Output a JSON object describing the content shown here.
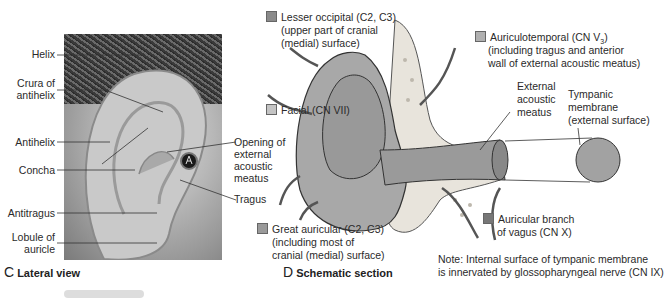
{
  "panel_c": {
    "caption_letter": "C",
    "caption_text": "Lateral view",
    "labels": {
      "helix": "Helix",
      "crura_1": "Crura of",
      "crura_2": "antihelix",
      "antihelix": "Antihelix",
      "concha": "Concha",
      "antitragus": "Antitragus",
      "lobule_1": "Lobule of",
      "lobule_2": "auricle",
      "opening_1": "Opening of",
      "opening_2": "external",
      "opening_3": "acoustic",
      "opening_4": "meatus",
      "tragus": "Tragus"
    }
  },
  "panel_d": {
    "caption_letter": "D",
    "caption_text": "Schematic section",
    "legend_colors": {
      "lesser_occipital": "#8a8a8a",
      "facial": "#c4c4c4",
      "auriculotemporal": "#b0b0b0",
      "great_auricular": "#9a9a9a",
      "vagus": "#777777"
    },
    "labels": {
      "lesser_occipital_1": "Lesser occipital (C2, C3)",
      "lesser_occipital_2": "(upper part of cranial",
      "lesser_occipital_3": "(medial) surface)",
      "facial": "Facial (CN VII)",
      "auriculotemporal_1": "Auriculotemporal (CN V",
      "auriculotemporal_sub": "3",
      "auriculotemporal_close": ")",
      "auriculotemporal_2": "(including tragus and anterior",
      "auriculotemporal_3": "wall of external acoustic meatus)",
      "eam_1": "External",
      "eam_2": "acoustic",
      "eam_3": "meatus",
      "tympanic_1": "Tympanic",
      "tympanic_2": "membrane",
      "tympanic_3": "(external surface)",
      "great_auricular_1": "Great auricular (C2, C3)",
      "great_auricular_2": "(including most of",
      "great_auricular_3": "cranial (medial) surface)",
      "vagus_1": "Auricular branch",
      "vagus_2": "of vagus (CN X)",
      "note_1": "Note: Internal surface of tympanic membrane",
      "note_2": "is innervated by glossopharyngeal nerve (CN IX)"
    }
  }
}
